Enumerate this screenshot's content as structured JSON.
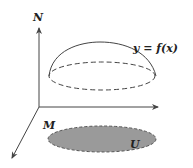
{
  "diagram": {
    "labels": {
      "vertical_axis": "N",
      "base_space": "M",
      "region": "U",
      "graph": "y = f(x)"
    },
    "colors": {
      "stroke": "#444444",
      "region_fill": "#999999",
      "background": "#ffffff"
    },
    "elements": {
      "vertical_axis": {
        "from": [
          39,
          107
        ],
        "to": [
          39,
          28
        ]
      },
      "horizontal_axis": {
        "from": [
          39,
          107
        ],
        "to": [
          158,
          107
        ]
      },
      "diagonal_axis": {
        "from": [
          39,
          107
        ],
        "to": [
          12,
          158
        ]
      },
      "dome_top": [
        100,
        42
      ],
      "dashed_ellipse": {
        "cx": 102,
        "cy": 76,
        "rx": 53,
        "ry": 14
      },
      "region_ellipse": {
        "cx": 102,
        "cy": 139,
        "rx": 54,
        "ry": 13
      }
    }
  }
}
